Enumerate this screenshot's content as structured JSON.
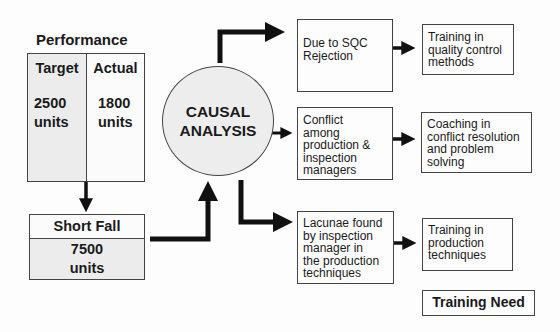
{
  "performance": {
    "title": "Performance",
    "target": {
      "label": "Target",
      "value": "2500",
      "unit": "units"
    },
    "actual": {
      "label": "Actual",
      "value": "1800",
      "unit": "units"
    }
  },
  "shortfall": {
    "label": "Short Fall",
    "value": "7500",
    "unit": "units"
  },
  "analysis": {
    "line1": "CAUSAL",
    "line2": "ANALYSIS"
  },
  "causes": [
    {
      "lines": [
        "Due to SQC",
        "Rejection"
      ]
    },
    {
      "lines": [
        "Conflict",
        "among",
        "production &",
        "inspection",
        "managers"
      ]
    },
    {
      "lines": [
        "Lacunae found",
        "by inspection",
        "manager in",
        "the production",
        "techniques"
      ]
    }
  ],
  "needs": [
    {
      "lines": [
        "Training in",
        "quality control",
        "methods"
      ]
    },
    {
      "lines": [
        "Coaching in",
        "conflict resolution",
        "and problem",
        "solving"
      ]
    },
    {
      "lines": [
        "Training in",
        "production",
        "techniques"
      ]
    }
  ],
  "legend": {
    "label": "Training Need"
  }
}
